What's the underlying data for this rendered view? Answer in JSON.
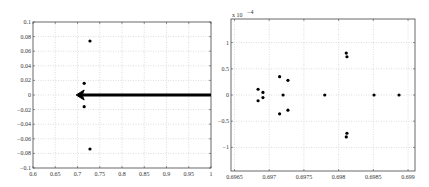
{
  "chart_data": [
    {
      "type": "scatter",
      "title": "",
      "xlabel": "",
      "ylabel": "",
      "xlim": [
        0.6,
        1.0
      ],
      "ylim": [
        -0.1,
        0.1
      ],
      "grid": true,
      "x_ticks": [
        "0.6",
        "0.65",
        "0.7",
        "0.75",
        "0.8",
        "0.85",
        "0.9",
        "0.95",
        "1"
      ],
      "y_ticks": [
        "0.1",
        "0.08",
        "0.06",
        "0.04",
        "0.02",
        "0",
        "-0.02",
        "-0.04",
        "-0.06",
        "-0.08",
        "-0.1"
      ],
      "points": [
        {
          "x": 0.728,
          "y": 0.074
        },
        {
          "x": 0.715,
          "y": 0.016
        },
        {
          "x": 0.715,
          "y": -0.016
        },
        {
          "x": 0.728,
          "y": -0.074
        }
      ],
      "annotations": [
        {
          "type": "arrow",
          "from": {
            "x": 1.0,
            "y": 0.0
          },
          "to": {
            "x": 0.697,
            "y": 0.0
          },
          "description": "thick arrow pointing left toward zoomed cluster"
        }
      ]
    },
    {
      "type": "scatter",
      "title": "",
      "xlabel": "",
      "ylabel": "",
      "y_scale_label": "x 10^-4",
      "xlim": [
        0.69645,
        0.6991
      ],
      "ylim": [
        -1.45,
        1.45
      ],
      "grid": true,
      "x_ticks": [
        "0.6965",
        "0.697",
        "0.6975",
        "0.698",
        "0.6985",
        "0.699"
      ],
      "y_ticks": [
        "1",
        "0.5",
        "0",
        "-0.5",
        "-1"
      ],
      "points": [
        {
          "x": 0.69684,
          "y": 0.11
        },
        {
          "x": 0.69684,
          "y": -0.11
        },
        {
          "x": 0.69691,
          "y": 0.05
        },
        {
          "x": 0.69691,
          "y": -0.05
        },
        {
          "x": 0.69715,
          "y": 0.35
        },
        {
          "x": 0.69715,
          "y": -0.36
        },
        {
          "x": 0.6972,
          "y": 0.0
        },
        {
          "x": 0.69727,
          "y": 0.28
        },
        {
          "x": 0.69727,
          "y": -0.29
        },
        {
          "x": 0.6978,
          "y": 0.0
        },
        {
          "x": 0.69811,
          "y": 0.8
        },
        {
          "x": 0.69812,
          "y": 0.73
        },
        {
          "x": 0.69811,
          "y": -0.8
        },
        {
          "x": 0.69812,
          "y": -0.73
        },
        {
          "x": 0.69851,
          "y": 0.0
        },
        {
          "x": 0.69887,
          "y": 0.0
        }
      ]
    }
  ]
}
